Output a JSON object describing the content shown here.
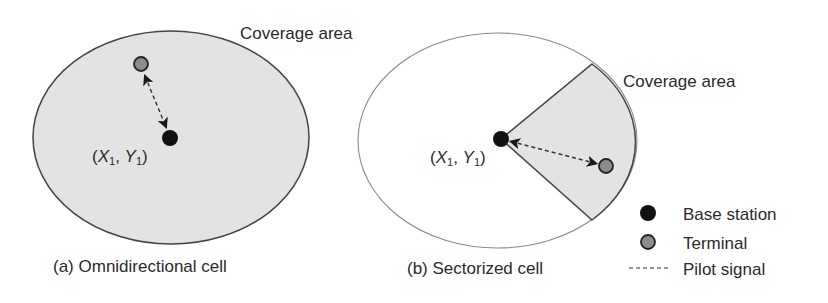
{
  "colors": {
    "coverage_fill": "#e3e3e3",
    "outline": "#444444",
    "thin_outline": "#8a8a8a",
    "base_station": "#111111",
    "terminal": "#8c8c8c",
    "pilot_signal": "#333333"
  },
  "panel_a": {
    "coverage_label": "Coverage area",
    "base_station_coord": {
      "open": "(",
      "x": "X",
      "x_sub": "1",
      "sep": ", ",
      "y": "Y",
      "y_sub": "1",
      "close": ")"
    },
    "caption": "(a) Omnidirectional cell"
  },
  "panel_b": {
    "coverage_label": "Coverage area",
    "base_station_coord": {
      "open": "(",
      "x": "X",
      "x_sub": "1",
      "sep": ", ",
      "y": "Y",
      "y_sub": "1",
      "close": ")"
    },
    "caption": "(b) Sectorized cell"
  },
  "legend": {
    "items": [
      {
        "icon": "base-station-dot",
        "label": "Base station"
      },
      {
        "icon": "terminal-dot",
        "label": "Terminal"
      },
      {
        "icon": "dashed-line",
        "label": "Pilot signal"
      }
    ]
  }
}
